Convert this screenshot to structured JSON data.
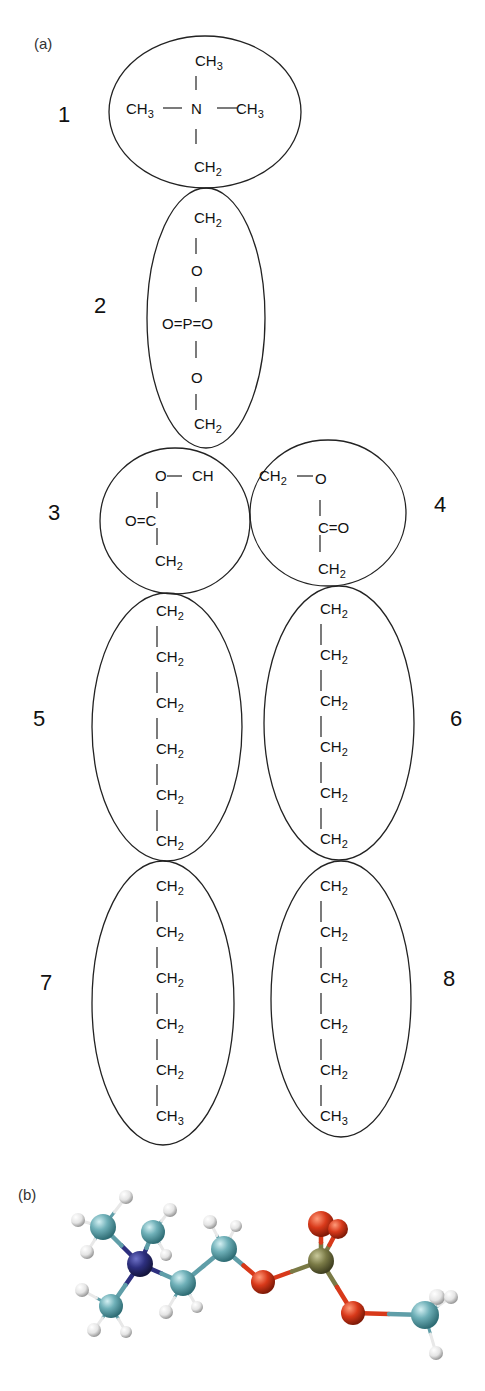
{
  "figure": {
    "panel_a_label": "(a)",
    "panel_b_label": "(b)",
    "colors": {
      "line": "#222222",
      "carbon": "#5f9ea8",
      "hydrogen": "#e8e8e8",
      "nitrogen": "#2d2f7e",
      "oxygen": "#d8391a",
      "phosphorus": "#7a7a46",
      "background": "#ffffff"
    }
  },
  "beads": [
    {
      "num": "1",
      "num_x": 58,
      "num_y": 122,
      "cx": 205,
      "cy": 112,
      "rx": 96,
      "ry": 76
    },
    {
      "num": "2",
      "num_x": 94,
      "num_y": 313,
      "cx": 206,
      "cy": 318,
      "rx": 59,
      "ry": 130
    },
    {
      "num": "3",
      "num_x": 48,
      "num_y": 520,
      "cx": 175,
      "cy": 521,
      "rx": 75,
      "ry": 73
    },
    {
      "num": "4",
      "num_x": 434,
      "num_y": 512,
      "cx": 328,
      "cy": 513,
      "rx": 78,
      "ry": 73
    },
    {
      "num": "5",
      "num_x": 33,
      "num_y": 726,
      "cx": 167,
      "cy": 727,
      "rx": 75,
      "ry": 134
    },
    {
      "num": "6",
      "num_x": 450,
      "num_y": 726,
      "cx": 339,
      "cy": 723,
      "rx": 75,
      "ry": 137
    },
    {
      "num": "7",
      "num_x": 40,
      "num_y": 990,
      "cx": 163,
      "cy": 1003,
      "rx": 71,
      "ry": 142
    },
    {
      "num": "8",
      "num_x": 443,
      "num_y": 986,
      "cx": 341,
      "cy": 999,
      "rx": 70,
      "ry": 138
    }
  ],
  "bead1": {
    "top": "CH",
    "top_sub": "3",
    "left": "CH",
    "left_sub": "3",
    "center": "N",
    "right": "CH",
    "right_sub": "3",
    "bottom": "CH",
    "bottom_sub": "2"
  },
  "bead2": {
    "top": "CH",
    "top_sub": "2",
    "o_upper": "O",
    "phosphate": "O=P=O",
    "o_lower": "O",
    "bottom": "CH",
    "bottom_sub": "2"
  },
  "bead3": {
    "o": "O",
    "ch": "CH",
    "carbonyl": "O=C",
    "bottom": "CH",
    "bottom_sub": "2"
  },
  "bead4": {
    "ch": "CH",
    "ch_sub": "2",
    "o": "O",
    "carbonyl": "C=O",
    "bottom": "CH",
    "bottom_sub": "2"
  },
  "chains": {
    "bead5": [
      "CH2",
      "CH2",
      "CH2",
      "CH2",
      "CH2",
      "CH2"
    ],
    "bead6": [
      "CH2",
      "CH2",
      "CH2",
      "CH2",
      "CH2",
      "CH2"
    ],
    "bead7": [
      "CH2",
      "CH2",
      "CH2",
      "CH2",
      "CH2",
      "CH3"
    ],
    "bead8": [
      "CH2",
      "CH2",
      "CH2",
      "CH2",
      "CH2",
      "CH3"
    ]
  },
  "chain_text": {
    "ch": "CH",
    "sub2": "2",
    "sub3": "3"
  },
  "molecule": {
    "atoms": [
      {
        "el": "C",
        "x": 103,
        "y": 1227,
        "r": 13
      },
      {
        "el": "C",
        "x": 153,
        "y": 1232,
        "r": 12
      },
      {
        "el": "N",
        "x": 140,
        "y": 1264,
        "r": 13
      },
      {
        "el": "C",
        "x": 111,
        "y": 1306,
        "r": 12
      },
      {
        "el": "C",
        "x": 183,
        "y": 1283,
        "r": 13
      },
      {
        "el": "C",
        "x": 224,
        "y": 1249,
        "r": 13
      },
      {
        "el": "O",
        "x": 263,
        "y": 1282,
        "r": 12
      },
      {
        "el": "P",
        "x": 321,
        "y": 1261,
        "r": 13
      },
      {
        "el": "O",
        "x": 321,
        "y": 1224,
        "r": 13
      },
      {
        "el": "O",
        "x": 338,
        "y": 1229,
        "r": 10
      },
      {
        "el": "O",
        "x": 353,
        "y": 1313,
        "r": 12
      },
      {
        "el": "C",
        "x": 425,
        "y": 1315,
        "r": 14
      },
      {
        "el": "H",
        "x": 78,
        "y": 1220,
        "r": 7
      },
      {
        "el": "H",
        "x": 126,
        "y": 1197,
        "r": 7
      },
      {
        "el": "H",
        "x": 87,
        "y": 1252,
        "r": 7
      },
      {
        "el": "H",
        "x": 170,
        "y": 1210,
        "r": 7
      },
      {
        "el": "H",
        "x": 166,
        "y": 1255,
        "r": 6
      },
      {
        "el": "H",
        "x": 82,
        "y": 1290,
        "r": 7
      },
      {
        "el": "H",
        "x": 94,
        "y": 1330,
        "r": 7
      },
      {
        "el": "H",
        "x": 126,
        "y": 1332,
        "r": 6
      },
      {
        "el": "H",
        "x": 166,
        "y": 1312,
        "r": 7
      },
      {
        "el": "H",
        "x": 197,
        "y": 1307,
        "r": 6
      },
      {
        "el": "H",
        "x": 210,
        "y": 1222,
        "r": 7
      },
      {
        "el": "H",
        "x": 236,
        "y": 1226,
        "r": 6
      },
      {
        "el": "H",
        "x": 437,
        "y": 1297,
        "r": 8
      },
      {
        "el": "H",
        "x": 451,
        "y": 1297,
        "r": 7
      },
      {
        "el": "H",
        "x": 436,
        "y": 1353,
        "r": 7
      }
    ],
    "bonds": [
      [
        2,
        0
      ],
      [
        2,
        1
      ],
      [
        2,
        3
      ],
      [
        2,
        4
      ],
      [
        4,
        5
      ],
      [
        5,
        6
      ],
      [
        6,
        7
      ],
      [
        7,
        8
      ],
      [
        7,
        9
      ],
      [
        7,
        10
      ],
      [
        10,
        11
      ],
      [
        0,
        12
      ],
      [
        0,
        13
      ],
      [
        0,
        14
      ],
      [
        1,
        15
      ],
      [
        1,
        16
      ],
      [
        3,
        17
      ],
      [
        3,
        18
      ],
      [
        3,
        19
      ],
      [
        4,
        20
      ],
      [
        4,
        21
      ],
      [
        5,
        22
      ],
      [
        5,
        23
      ],
      [
        11,
        24
      ],
      [
        11,
        25
      ],
      [
        11,
        26
      ]
    ]
  }
}
